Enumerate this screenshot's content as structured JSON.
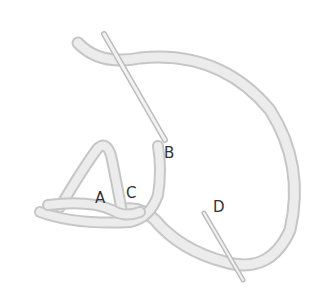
{
  "diagram": {
    "labels": [
      {
        "id": "A",
        "text": "A",
        "x": 95,
        "y": 191
      },
      {
        "id": "B",
        "text": "B",
        "x": 164,
        "y": 146
      },
      {
        "id": "C",
        "text": "C",
        "x": 126,
        "y": 186
      },
      {
        "id": "D",
        "text": "D",
        "x": 213,
        "y": 200
      }
    ],
    "colors": {
      "thread": "#e6e6e6",
      "thread_shade": "#c4c4c4",
      "needle": "#eeeeee",
      "label": "#333333"
    }
  }
}
